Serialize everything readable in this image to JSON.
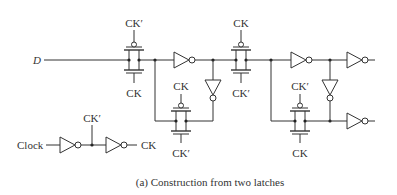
{
  "diagram": {
    "caption": "(a) Construction from two latches",
    "input_label": "D",
    "clock_label": "Clock",
    "clock_buffer": {
      "mid_label": "CK′",
      "out_label": "CK"
    },
    "transmission_gates": [
      {
        "id": "tg1-master-input",
        "top_label": "CK′",
        "bottom_label": "CK"
      },
      {
        "id": "tg2-master-feedback",
        "top_label": "CK",
        "bottom_label": "CK′"
      },
      {
        "id": "tg3-slave-input",
        "top_label": "CK",
        "bottom_label": "CK′"
      },
      {
        "id": "tg4-slave-feedback",
        "top_label": "CK′",
        "bottom_label": "CK"
      }
    ],
    "inverters": [
      "master-forward-inverter",
      "master-feedback-inverter",
      "slave-forward-inverter",
      "slave-feedback-inverter",
      "output-inverter-q",
      "output-inverter-qbar",
      "clock-inverter-1",
      "clock-inverter-2"
    ]
  }
}
